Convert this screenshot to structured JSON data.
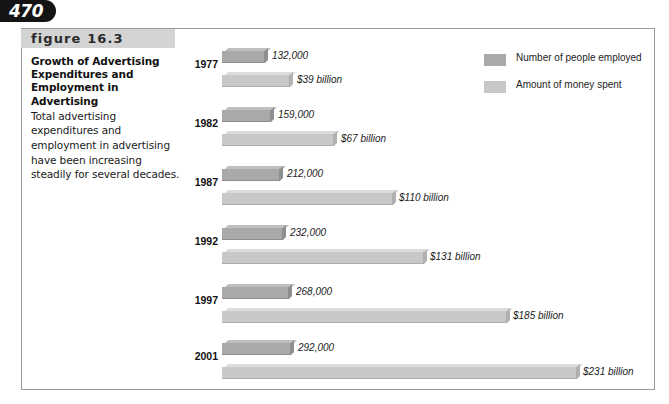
{
  "page": {
    "number": "470"
  },
  "figure": {
    "band_label": "figure 16.3",
    "title": "Growth of Advertising Expenditures and Employment in Advertising",
    "description": "Total advertising expenditures and employment in advertising have been increasing steadily for several decades.",
    "source_note": ""
  },
  "legend": {
    "items": [
      {
        "label": "Number of people employed",
        "swatch": "dark",
        "color": "#a9a9a9"
      },
      {
        "label": "Amount of money spent",
        "swatch": "light",
        "color": "#c8c8c8"
      }
    ]
  },
  "colors": {
    "employment_bar": "#a9a9a9",
    "money_bar": "#c8c8c8",
    "band": "#d4d4d4",
    "frame_border": "#9a9a9a",
    "page_tab": "#141414"
  },
  "chart_data": {
    "type": "bar",
    "orientation": "horizontal",
    "title": "Growth of Advertising Expenditures and Employment in Advertising",
    "xlabel": "",
    "ylabel": "",
    "categories": [
      "1977",
      "1982",
      "1987",
      "1992",
      "1997",
      "2001"
    ],
    "grid": false,
    "legend_position": "top-right",
    "series": [
      {
        "name": "Number of people employed",
        "unit": "people",
        "color": "#a9a9a9",
        "values": [
          132000,
          159000,
          212000,
          232000,
          268000,
          292000
        ],
        "labels": [
          "132,000",
          "159,000",
          "212,000",
          "232,000",
          "268,000",
          "292,000"
        ]
      },
      {
        "name": "Amount of money spent",
        "unit": "billions of dollars",
        "color": "#c8c8c8",
        "values": [
          39,
          67,
          110,
          131,
          185,
          231
        ],
        "labels": [
          "$39 billion",
          "$67 billion",
          "$110 billion",
          "$131 billion",
          "$185 billion",
          "$231 billion"
        ]
      }
    ]
  },
  "render": {
    "groups": [
      {
        "year": "1977",
        "year_top": 58,
        "emp_top": 48,
        "emp_width": 43,
        "emp_label": "132,000",
        "emp_label_left": 272,
        "mon_top": 72,
        "mon_width": 68,
        "mon_label": "$39 billion",
        "mon_label_left": 297
      },
      {
        "year": "1982",
        "year_top": 117,
        "emp_top": 107,
        "emp_width": 49,
        "emp_label": "159,000",
        "emp_label_left": 278,
        "mon_top": 131,
        "mon_width": 112,
        "mon_label": "$67 billion",
        "mon_label_left": 341
      },
      {
        "year": "1987",
        "year_top": 176,
        "emp_top": 166,
        "emp_width": 58,
        "emp_label": "212,000",
        "emp_label_left": 287,
        "mon_top": 190,
        "mon_width": 171,
        "mon_label": "$110 billion",
        "mon_label_left": 399
      },
      {
        "year": "1992",
        "year_top": 235,
        "emp_top": 225,
        "emp_width": 61,
        "emp_label": "232,000",
        "emp_label_left": 290,
        "mon_top": 249,
        "mon_width": 202,
        "mon_label": "$131 billion",
        "mon_label_left": 430
      },
      {
        "year": "1997",
        "year_top": 294,
        "emp_top": 284,
        "emp_width": 67,
        "emp_label": "268,000",
        "emp_label_left": 296,
        "mon_top": 308,
        "mon_width": 285,
        "mon_label": "$185 billion",
        "mon_label_left": 513
      },
      {
        "year": "2001",
        "year_top": 350,
        "emp_top": 340,
        "emp_width": 69,
        "emp_label": "292,000",
        "emp_label_left": 298,
        "mon_top": 364,
        "mon_width": 355,
        "mon_label": "$231 billion",
        "mon_label_left": 583
      }
    ]
  }
}
